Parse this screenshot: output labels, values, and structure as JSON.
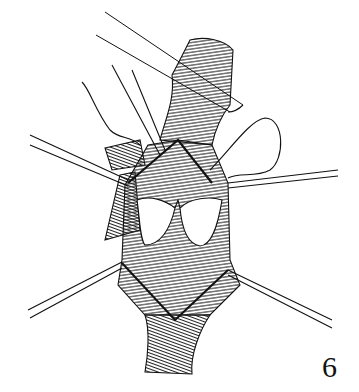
{
  "figure": {
    "number": "6",
    "colors": {
      "ink": "#111111",
      "background": "#ffffff"
    }
  }
}
